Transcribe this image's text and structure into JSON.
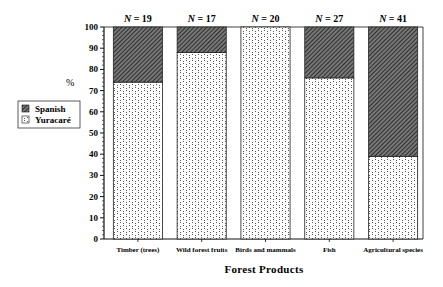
{
  "chart_data": {
    "type": "bar",
    "stacked": true,
    "percent": true,
    "title": "",
    "xlabel": "Forest Products",
    "ylabel": "%",
    "ylim": [
      0,
      100
    ],
    "yticks": [
      0,
      10,
      20,
      30,
      40,
      50,
      60,
      70,
      80,
      90,
      100
    ],
    "grid": false,
    "legend_position": "left",
    "categories": [
      "Timber (trees)",
      "Wild forest fruits",
      "Birds and mammals",
      "Fish",
      "Agricultural species"
    ],
    "sample_sizes": [
      "N = 19",
      "N = 17",
      "N = 20",
      "N = 27",
      "N = 41"
    ],
    "series": [
      {
        "name": "Yuracaré",
        "pattern": "dotted-crosshatch",
        "values": [
          74,
          88,
          100,
          76,
          39
        ]
      },
      {
        "name": "Spanish",
        "pattern": "dark-diagonal-hatch",
        "values": [
          26,
          12,
          0,
          24,
          61
        ]
      }
    ]
  }
}
